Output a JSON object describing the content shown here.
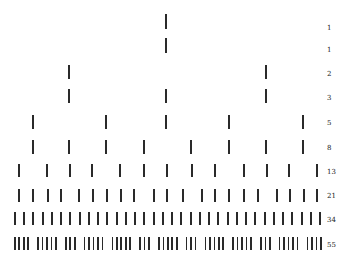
{
  "diagram": {
    "bar_color": "#2a2a2a",
    "rows": [
      {
        "label": "1",
        "y": 14,
        "h": 15,
        "xs": [
          165
        ]
      },
      {
        "label": "1",
        "y": 38,
        "h": 15,
        "xs": [
          165
        ]
      },
      {
        "label": "2",
        "y": 65,
        "h": 14,
        "xs": [
          68,
          265
        ]
      },
      {
        "label": "3",
        "y": 89,
        "h": 14,
        "xs": [
          68,
          165,
          265
        ]
      },
      {
        "label": "5",
        "y": 115,
        "h": 14,
        "xs": [
          32,
          105,
          165,
          228,
          302
        ]
      },
      {
        "label": "8",
        "y": 140,
        "h": 14,
        "xs": [
          32,
          68,
          105,
          143,
          190,
          228,
          265,
          302
        ]
      },
      {
        "label": "13",
        "y": 164,
        "h": 13,
        "xs": [
          18,
          46,
          69,
          91,
          119,
          143,
          166,
          191,
          214,
          243,
          266,
          288,
          316
        ]
      },
      {
        "label": "21",
        "y": 189,
        "h": 13,
        "xs": [
          18,
          32,
          47,
          60,
          78,
          92,
          106,
          120,
          133,
          153,
          166,
          182,
          201,
          214,
          228,
          243,
          257,
          276,
          289,
          303,
          316
        ]
      },
      {
        "label": "34",
        "y": 212,
        "h": 13,
        "xs": [
          14,
          23,
          32,
          42,
          51,
          60,
          69,
          79,
          88,
          97,
          106,
          116,
          125,
          134,
          143,
          153,
          162,
          171,
          180,
          190,
          199,
          208,
          217,
          227,
          236,
          245,
          254,
          264,
          273,
          282,
          291,
          301,
          310,
          319
        ]
      },
      {
        "label": "55",
        "y": 237,
        "h": 13,
        "groups": [
          4,
          5,
          3,
          5,
          5,
          3,
          5,
          3,
          5,
          5,
          3,
          5,
          4
        ],
        "x_start": 14,
        "x_end": 320
      }
    ],
    "label_offsets_y": [
      28,
      50,
      74,
      98,
      123,
      148,
      172,
      196,
      220,
      245
    ]
  }
}
